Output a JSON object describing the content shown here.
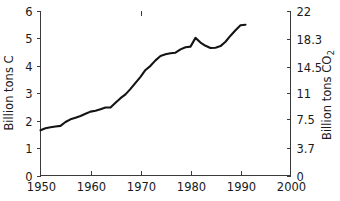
{
  "chart_data": {
    "type": "line",
    "title": "",
    "subtitle": "",
    "xlabel": "",
    "ylabel": "Billion tons C",
    "ylabel_right": "Billion tons CO",
    "ylabel_right_sub": "2",
    "xlim": [
      1950,
      2000
    ],
    "ylim": [
      0,
      6
    ],
    "ylim_right": [
      0,
      22
    ],
    "grid": false,
    "legend": false,
    "legend_position": "none",
    "xticks": [
      1950,
      1960,
      1970,
      1980,
      1990,
      2000
    ],
    "xticklabels": [
      "1950",
      "1960",
      "1970",
      "1980",
      "1990",
      "2000"
    ],
    "yticks": [
      0,
      1,
      2,
      3,
      4,
      5,
      6
    ],
    "yticklabels": [
      "0",
      "1",
      "2",
      "3",
      "4",
      "5",
      "6"
    ],
    "yticks_right": [
      0,
      3.7,
      7.5,
      11,
      14.5,
      18.3,
      22
    ],
    "yticklabels_right": [
      "0",
      "3.7",
      "7.5",
      "11",
      "14.5",
      "18.3",
      "22"
    ],
    "line_color": "#141414",
    "axis_color": "#3a3a3a",
    "series": [
      {
        "name": "Global carbon emissions from fossil fuel burning",
        "x": [
          1950,
          1951,
          1952,
          1953,
          1954,
          1955,
          1956,
          1957,
          1958,
          1959,
          1960,
          1961,
          1962,
          1963,
          1964,
          1965,
          1966,
          1967,
          1968,
          1969,
          1970,
          1971,
          1972,
          1973,
          1974,
          1975,
          1976,
          1977,
          1978,
          1979,
          1980,
          1981,
          1982,
          1983,
          1984,
          1985,
          1986,
          1987,
          1988,
          1989,
          1990,
          1991
        ],
        "values": [
          1.65,
          1.72,
          1.76,
          1.79,
          1.81,
          1.95,
          2.05,
          2.11,
          2.17,
          2.25,
          2.33,
          2.36,
          2.42,
          2.48,
          2.48,
          2.65,
          2.82,
          2.96,
          3.16,
          3.38,
          3.6,
          3.85,
          4.0,
          4.2,
          4.36,
          4.42,
          4.46,
          4.48,
          4.6,
          4.68,
          4.7,
          5.02,
          4.85,
          4.73,
          4.65,
          4.66,
          4.72,
          4.88,
          5.1,
          5.3,
          5.48,
          5.5
        ]
      }
    ]
  }
}
